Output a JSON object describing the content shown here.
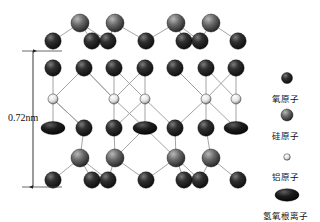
{
  "figure": {
    "title": "",
    "type": "crystal-structure-diagram"
  },
  "dimension": {
    "label": "0.72nm",
    "axis": "vertical",
    "y_top": 51,
    "y_bottom": 187
  },
  "legend": {
    "items": [
      {
        "key": "oxygen",
        "label": "氧原子",
        "shape": "circle",
        "size": 11,
        "color": "#1a1a1a",
        "highlight": "#6b6b6b",
        "cx": 287,
        "cy": 78
      },
      {
        "key": "silicon",
        "label": "硅原子",
        "shape": "circle",
        "size": 12,
        "color": "#3a3a3a",
        "highlight": "#9a9a9a",
        "cx": 287,
        "cy": 115
      },
      {
        "key": "aluminum",
        "label": "铝原子",
        "shape": "circle",
        "size": 6.5,
        "color": "#777777",
        "highlight": "#ffffff",
        "cx": 287,
        "cy": 157
      },
      {
        "key": "hydroxyl",
        "label": "氢氧根离子",
        "shape": "ellipse",
        "size": 12,
        "color": "#111111",
        "highlight": "#555555",
        "cx": 287,
        "cy": 195
      }
    ],
    "label_offsets_y": [
      14,
      14,
      13,
      14
    ]
  },
  "palette": {
    "background": "#ffffff",
    "bond": "#9a9a9a",
    "dimension_line": "#333333",
    "text": "#111111"
  },
  "chart_data": {
    "type": "scatter",
    "xlabel": "",
    "ylabel": "",
    "xlim": [
      30,
      255
    ],
    "ylim": [
      0,
      222
    ],
    "grid": false,
    "legend_position": "right",
    "series": [
      {
        "name": "氧原子",
        "key": "oxygen",
        "shape": "circle",
        "r": 8.2,
        "fill": "#1a1a1a",
        "highlight": "#6f6f6f",
        "points": [
          [
            53,
            41
          ],
          [
            92,
            41
          ],
          [
            108,
            41
          ],
          [
            146,
            41
          ],
          [
            184,
            41
          ],
          [
            200,
            41
          ],
          [
            238,
            41
          ],
          [
            53,
            68
          ],
          [
            84,
            68
          ],
          [
            114,
            68
          ],
          [
            145,
            68
          ],
          [
            175,
            68
          ],
          [
            206,
            68
          ],
          [
            236,
            68
          ],
          [
            84,
            128
          ],
          [
            114,
            128
          ],
          [
            175,
            128
          ],
          [
            206,
            128
          ],
          [
            53,
            180
          ],
          [
            92,
            180
          ],
          [
            108,
            180
          ],
          [
            146,
            180
          ],
          [
            184,
            180
          ],
          [
            200,
            180
          ],
          [
            238,
            180
          ]
        ]
      },
      {
        "name": "硅原子",
        "key": "silicon",
        "shape": "circle",
        "r": 9.0,
        "fill": "#3c3c3c",
        "highlight": "#a8a8a8",
        "points": [
          [
            80,
            23
          ],
          [
            115,
            23
          ],
          [
            176,
            23
          ],
          [
            211,
            23
          ],
          [
            80,
            158
          ],
          [
            115,
            158
          ],
          [
            176,
            158
          ],
          [
            211,
            158
          ]
        ]
      },
      {
        "name": "铝原子",
        "key": "aluminum",
        "shape": "circle",
        "r": 5.0,
        "fill": "#8a8a8a",
        "highlight": "#ffffff",
        "points": [
          [
            53,
            99
          ],
          [
            114,
            99
          ],
          [
            145,
            99
          ],
          [
            206,
            99
          ],
          [
            236,
            99
          ]
        ]
      },
      {
        "name": "氢氧根离子",
        "key": "hydroxyl",
        "shape": "ellipse",
        "rx": 12,
        "ry": 6.5,
        "fill": "#111111",
        "highlight": "#4f4f4f",
        "points": [
          [
            53,
            128
          ],
          [
            145,
            128
          ],
          [
            236,
            128
          ]
        ]
      }
    ],
    "bonds": [
      [
        53,
        41,
        80,
        23
      ],
      [
        80,
        23,
        92,
        41
      ],
      [
        80,
        23,
        108,
        41
      ],
      [
        108,
        41,
        115,
        23
      ],
      [
        115,
        23,
        146,
        41
      ],
      [
        146,
        41,
        176,
        23
      ],
      [
        176,
        23,
        184,
        41
      ],
      [
        176,
        23,
        200,
        41
      ],
      [
        200,
        41,
        211,
        23
      ],
      [
        211,
        23,
        238,
        41
      ],
      [
        53,
        68,
        53,
        99
      ],
      [
        53,
        99,
        53,
        128
      ],
      [
        84,
        68,
        114,
        99
      ],
      [
        114,
        68,
        114,
        99
      ],
      [
        114,
        99,
        114,
        128
      ],
      [
        145,
        68,
        145,
        99
      ],
      [
        145,
        99,
        145,
        128
      ],
      [
        175,
        68,
        206,
        99
      ],
      [
        206,
        68,
        206,
        99
      ],
      [
        206,
        99,
        206,
        128
      ],
      [
        236,
        68,
        236,
        99
      ],
      [
        236,
        99,
        236,
        128
      ],
      [
        53,
        99,
        84,
        68
      ],
      [
        53,
        99,
        84,
        128
      ],
      [
        114,
        99,
        145,
        68
      ],
      [
        114,
        99,
        84,
        68
      ],
      [
        145,
        99,
        114,
        68
      ],
      [
        145,
        99,
        175,
        128
      ],
      [
        206,
        99,
        236,
        68
      ],
      [
        206,
        99,
        175,
        68
      ],
      [
        236,
        99,
        206,
        68
      ],
      [
        114,
        99,
        145,
        128
      ],
      [
        145,
        99,
        114,
        128
      ],
      [
        206,
        99,
        236,
        128
      ],
      [
        53,
        99,
        84,
        128
      ],
      [
        206,
        99,
        175,
        128
      ],
      [
        84,
        128,
        80,
        158
      ],
      [
        114,
        128,
        115,
        158
      ],
      [
        175,
        128,
        176,
        158
      ],
      [
        206,
        128,
        211,
        158
      ],
      [
        145,
        128,
        115,
        158
      ],
      [
        145,
        128,
        176,
        158
      ],
      [
        80,
        158,
        53,
        180
      ],
      [
        80,
        158,
        92,
        180
      ],
      [
        80,
        158,
        108,
        180
      ],
      [
        115,
        158,
        108,
        180
      ],
      [
        115,
        158,
        146,
        180
      ],
      [
        176,
        158,
        146,
        180
      ],
      [
        176,
        158,
        184,
        180
      ],
      [
        176,
        158,
        200,
        180
      ],
      [
        211,
        158,
        200,
        180
      ],
      [
        211,
        158,
        238,
        180
      ]
    ]
  }
}
